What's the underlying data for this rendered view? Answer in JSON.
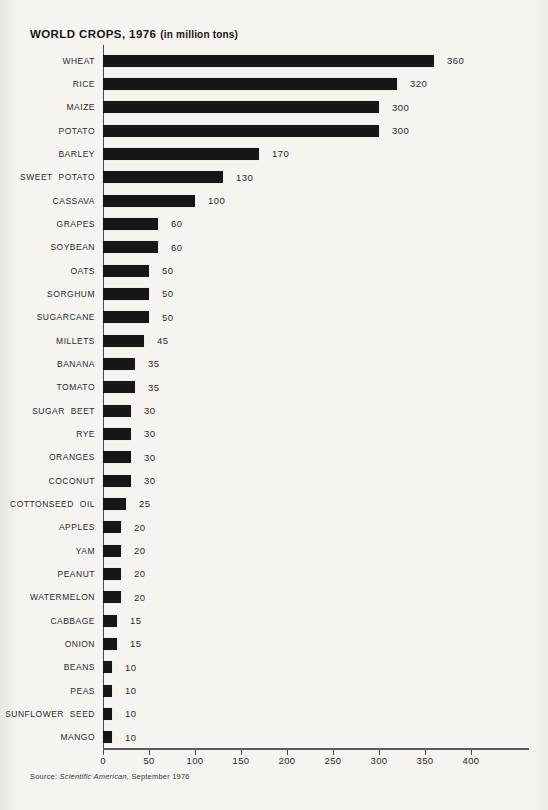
{
  "page": {
    "title": "WORLD CROPS, 1976",
    "title_suffix": "(in million tons)",
    "source_prefix": "Source: ",
    "source_italic": "Scientific American,",
    "source_suffix": " September 1976"
  },
  "colors": {
    "bar": "#161616",
    "background": "#f5f4f1",
    "axis": "#4a4a4a"
  },
  "chart_data": {
    "type": "bar",
    "orientation": "horizontal",
    "xlabel": "",
    "ylabel": "",
    "unit": "million tons",
    "grid": false,
    "legend": false,
    "xlim": [
      0,
      455
    ],
    "x_ticks": [
      0,
      50,
      100,
      150,
      200,
      250,
      300,
      350,
      400
    ],
    "categories": [
      "WHEAT",
      "RICE",
      "MAIZE",
      "POTATO",
      "BARLEY",
      "SWEET POTATO",
      "CASSAVA",
      "GRAPES",
      "SOYBEAN",
      "OATS",
      "SORGHUM",
      "SUGARCANE",
      "MILLETS",
      "BANANA",
      "TOMATO",
      "SUGAR BEET",
      "RYE",
      "ORANGES",
      "COCONUT",
      "COTTONSEED OIL",
      "APPLES",
      "YAM",
      "PEANUT",
      "WATERMELON",
      "CABBAGE",
      "ONION",
      "BEANS",
      "PEAS",
      "SUNFLOWER SEED",
      "MANGO"
    ],
    "values": [
      360,
      320,
      300,
      300,
      170,
      130,
      100,
      60,
      60,
      50,
      50,
      50,
      45,
      35,
      35,
      30,
      30,
      30,
      30,
      25,
      20,
      20,
      20,
      20,
      15,
      15,
      10,
      10,
      10,
      10
    ]
  }
}
